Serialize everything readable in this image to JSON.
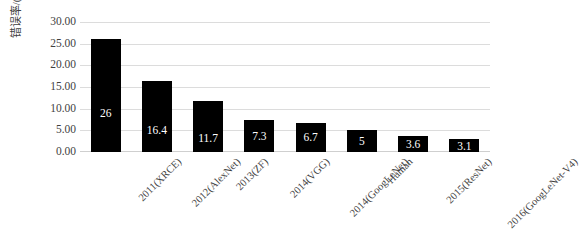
{
  "chart_data": {
    "type": "bar",
    "title": "",
    "subtitle": "",
    "xlabel": "",
    "ylabel": "错误率/(%)",
    "categories": [
      "2011(XRCE)",
      "2012(AlexNet)",
      "2013(ZF)",
      "2014(VGG)",
      "2014(GoogLeNet)",
      "Human",
      "2015(ResNet)",
      "2016(GoogLeNet-V4)"
    ],
    "values": [
      26,
      16.4,
      11.7,
      7.3,
      6.7,
      5,
      3.6,
      3.1
    ],
    "data_labels": [
      "26",
      "16.4",
      "11.7",
      "7.3",
      "6.7",
      "5",
      "3.6",
      "3.1"
    ],
    "ylim": [
      0,
      30
    ],
    "ytick_step": 5,
    "ytick_labels": [
      "0.00",
      "5.00",
      "10.00",
      "15.00",
      "20.00",
      "25.00",
      "30.00"
    ],
    "ytick_values": [
      0,
      5,
      10,
      15,
      20,
      25,
      30
    ],
    "grid": true,
    "grid_axis": "y",
    "legend": false,
    "legend_position": "none",
    "series_name": "错误率",
    "bar_color": "#000000",
    "data_label_color": "#FFFFFF",
    "grid_color": "#DCDCDC",
    "axis_text_color": "#3F3F3F",
    "background_color": "#FFFFFF",
    "xlabel_rotation_deg": -45
  }
}
